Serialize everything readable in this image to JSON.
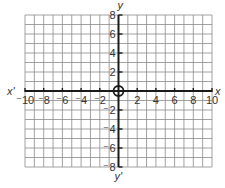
{
  "diagram": {
    "type": "coordinate-plane",
    "x_axis": {
      "label_positive": "x",
      "label_negative": "x'",
      "range": [
        -10,
        10
      ],
      "tick_labels": [
        "-10",
        "-8",
        "-6",
        "-4",
        "-2",
        "2",
        "4",
        "6",
        "8",
        "10"
      ],
      "tick_values": [
        -10,
        -8,
        -6,
        -4,
        -2,
        2,
        4,
        6,
        8,
        10
      ]
    },
    "y_axis": {
      "label_positive": "y",
      "label_negative": "y'",
      "range": [
        -8,
        8
      ],
      "tick_labels": [
        "8",
        "6",
        "4",
        "2",
        "-2",
        "-4",
        "-6",
        "-8"
      ],
      "tick_values": [
        8,
        6,
        4,
        2,
        -2,
        -4,
        -6,
        -8
      ]
    },
    "origin_label": "O",
    "grid": {
      "columns": 20,
      "rows": 16,
      "unit": 1
    },
    "colors": {
      "grid": "#8a8a8a",
      "axis": "#1a1a1a",
      "text": "#333333"
    }
  }
}
